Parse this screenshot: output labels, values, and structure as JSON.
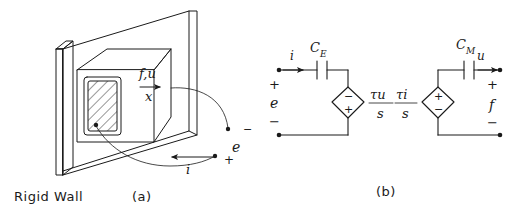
{
  "figure": {
    "background_color": "#ffffff",
    "ink_color": "#1a1a1a"
  },
  "panel_a": {
    "caption": "(a)",
    "wall_label": "Rigid Wall",
    "force_velocity_label": "f,u",
    "displacement_label": "x",
    "voltage_label": "e",
    "voltage_superscript": "−",
    "current_label": "i",
    "current_terminal_sign": "+",
    "icons": {
      "displacement_arrow": "arrow-right-icon",
      "current_arrow": "arrow-left-icon",
      "leader_top": "leader-curve-icon",
      "leader_bottom": "leader-curve-icon",
      "hatched_element": "hatched-rectangle-icon",
      "wall": "wall-slab-icon",
      "transducer_box": "box-3d-icon"
    }
  },
  "panel_b": {
    "caption": "(b)",
    "left_circuit": {
      "name": "electrical-port-circuit",
      "current_label": "i",
      "capacitor_label": "C",
      "capacitor_subscript": "E",
      "port_label": "e",
      "port_plus": "+",
      "port_minus": "−",
      "source_numerator": "τu",
      "source_denominator": "s",
      "source_top_sign": "−",
      "source_bottom_sign": "+",
      "icons": {
        "capacitor": "capacitor-icon",
        "source": "dependent-source-diamond-icon",
        "current_arrow": "arrow-right-icon",
        "terminal_top": "terminal-node-icon",
        "terminal_bottom": "terminal-node-icon"
      }
    },
    "right_circuit": {
      "name": "mechanical-port-circuit",
      "velocity_label": "u",
      "capacitor_label": "C",
      "capacitor_subscript": "M",
      "port_label": "f",
      "port_plus": "+",
      "port_minus": "−",
      "source_numerator": "τi",
      "source_denominator": "s",
      "source_top_sign": "+",
      "source_bottom_sign": "−",
      "icons": {
        "capacitor": "capacitor-icon",
        "source": "dependent-source-diamond-icon",
        "velocity_arrow": "arrow-right-icon",
        "terminal_top": "terminal-node-icon",
        "terminal_bottom": "terminal-node-icon"
      }
    }
  }
}
